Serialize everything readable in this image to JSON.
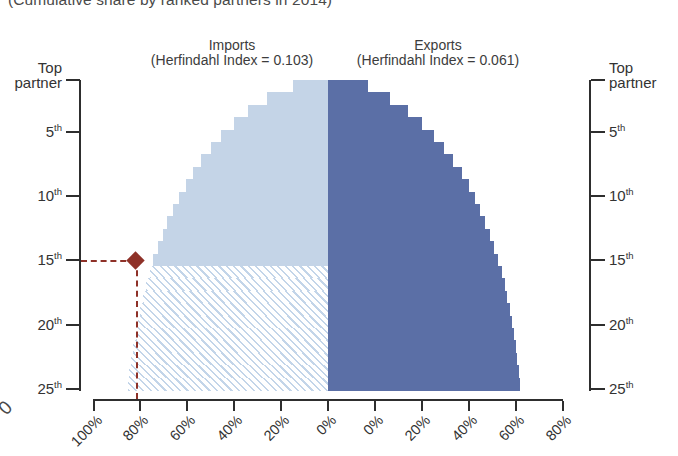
{
  "subtitle": "(Cumulative share by ranked partners in 2014)",
  "headers": {
    "imports": {
      "line1": "Imports",
      "line2": "(Herfindahl Index = 0.103)"
    },
    "exports": {
      "line1": "Exports",
      "line2": "(Herfindahl Index = 0.061)"
    }
  },
  "colors": {
    "imports": "#c4d4e7",
    "exports": "#5b6fa6",
    "annotation": "#8e3128",
    "axis": "#2e2e2e"
  },
  "crop_artifact_left": "0",
  "chart_data": {
    "type": "bar",
    "orientation": "horizontal-diverging",
    "title": "(Cumulative share by ranked partners in 2014)",
    "xlabel": "",
    "ylabel": "",
    "grid": false,
    "legend": "none",
    "center_value": 0,
    "xlim_left": [
      0,
      100
    ],
    "xlim_right": [
      0,
      100
    ],
    "x_ticks_left": [
      "100%",
      "80%",
      "60%",
      "40%",
      "20%",
      "0%"
    ],
    "x_ticks_right": [
      "0%",
      "20%",
      "40%",
      "60%",
      "80%",
      "100%"
    ],
    "x_tick_values": [
      100,
      80,
      60,
      40,
      20,
      0,
      20,
      40,
      60,
      80,
      100
    ],
    "y_ticks": [
      "Top partner",
      "5th",
      "10th",
      "15th",
      "20th",
      "25th"
    ],
    "y_tick_ranks": [
      1,
      5,
      10,
      15,
      20,
      25
    ],
    "y_axis_top_label_line1": "Top",
    "y_axis_top_label_line2": "partner",
    "ranks": [
      1,
      2,
      3,
      4,
      5,
      6,
      7,
      8,
      9,
      10,
      11,
      12,
      13,
      14,
      15,
      16,
      17,
      18,
      19,
      20,
      21,
      22,
      23,
      24,
      25
    ],
    "series": [
      {
        "name": "Imports",
        "side": "left",
        "herfindahl_index": 0.103,
        "unit": "%",
        "values": [
          15.0,
          26.0,
          34.0,
          40.0,
          45.5,
          50.0,
          54.0,
          57.5,
          60.5,
          63.5,
          66.0,
          68.5,
          70.5,
          72.5,
          74.5,
          76.0,
          77.5,
          79.0,
          80.0,
          81.0,
          82.0,
          83.0,
          84.0,
          84.8,
          85.5
        ]
      },
      {
        "name": "Exports",
        "side": "right",
        "herfindahl_index": 0.061,
        "unit": "%",
        "values": [
          17.0,
          26.5,
          34.0,
          40.0,
          45.0,
          49.5,
          53.5,
          57.0,
          60.0,
          62.5,
          65.0,
          67.0,
          69.0,
          70.8,
          72.5,
          74.0,
          75.3,
          76.5,
          77.5,
          78.5,
          79.3,
          80.0,
          80.7,
          81.3,
          82.0
        ]
      }
    ],
    "annotation": {
      "marker": "diamond",
      "color": "#8e3128",
      "rank": 15,
      "rank_label": "15th",
      "value": 82,
      "value_label": "82%",
      "side": "left",
      "style": "dashed-crosshair",
      "hatched_region": "imports cumulative area below 15th partner"
    }
  }
}
